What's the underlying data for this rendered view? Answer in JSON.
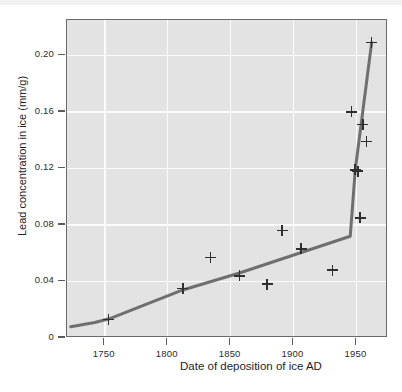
{
  "figure": {
    "background_color": "#ffffff",
    "plot_background_color": "#e3e3e3",
    "gridline_color": "#fbfbfb",
    "trend_line_color": "#6f6f6f",
    "marker_color": "#2f2f2f"
  },
  "chart_data": {
    "type": "scatter",
    "title": "",
    "xlabel": "Date of deposition of ice AD",
    "ylabel": "Lead concentration in ice (mm/g)",
    "xlim": [
      1720,
      1975
    ],
    "ylim": [
      0,
      0.225
    ],
    "grid": true,
    "legend": "none",
    "xticks": [
      1750,
      1800,
      1850,
      1900,
      1950
    ],
    "xtick_labels": [
      "1750",
      "1800",
      "1850",
      "1900",
      "1950"
    ],
    "yticks": [
      0,
      0.04,
      0.08,
      0.12,
      0.16,
      0.2
    ],
    "ytick_labels": [
      "0",
      "0.04",
      "0.08",
      "0.12",
      "0.16",
      "0.20"
    ],
    "points": [
      {
        "x": 1753,
        "y": 0.013
      },
      {
        "x": 1812,
        "y": 0.035
      },
      {
        "x": 1834,
        "y": 0.057
      },
      {
        "x": 1857,
        "y": 0.044
      },
      {
        "x": 1879,
        "y": 0.038
      },
      {
        "x": 1891,
        "y": 0.076
      },
      {
        "x": 1906,
        "y": 0.063
      },
      {
        "x": 1931,
        "y": 0.048
      },
      {
        "x": 1946,
        "y": 0.16
      },
      {
        "x": 1949,
        "y": 0.119
      },
      {
        "x": 1951,
        "y": 0.118
      },
      {
        "x": 1953,
        "y": 0.085
      },
      {
        "x": 1955,
        "y": 0.151
      },
      {
        "x": 1958,
        "y": 0.139
      },
      {
        "x": 1962,
        "y": 0.209
      }
    ],
    "trend_line": [
      {
        "x": 1723,
        "y": 0.008
      },
      {
        "x": 1742,
        "y": 0.011
      },
      {
        "x": 1755,
        "y": 0.014
      },
      {
        "x": 1812,
        "y": 0.034
      },
      {
        "x": 1857,
        "y": 0.046
      },
      {
        "x": 1945,
        "y": 0.072
      },
      {
        "x": 1949,
        "y": 0.119
      },
      {
        "x": 1962,
        "y": 0.209
      }
    ]
  }
}
